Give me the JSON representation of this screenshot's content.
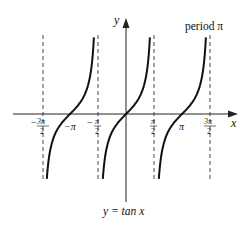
{
  "chart_data": {
    "type": "line",
    "title": "y = tan x",
    "annotation": "period π",
    "xlabel": "x",
    "ylabel": "y",
    "function": "tan(x)",
    "x_range": [
      -4.71,
      4.71
    ],
    "asymptotes": [
      "-3π/2",
      "-π/2",
      "π/2",
      "3π/2"
    ],
    "x_ticks": [
      {
        "value": -4.712,
        "label_num": "3π",
        "label_den": "2",
        "sign": "−"
      },
      {
        "value": -3.1416,
        "label": "−π"
      },
      {
        "value": -1.5708,
        "label_num": "π",
        "label_den": "2",
        "sign": "−"
      },
      {
        "value": 1.5708,
        "label_num": "π",
        "label_den": "2",
        "sign": ""
      },
      {
        "value": 3.1416,
        "label": "π"
      },
      {
        "value": 4.712,
        "label_num": "3π",
        "label_den": "2",
        "sign": ""
      }
    ],
    "zeros": [
      "-π",
      "0",
      "π"
    ],
    "series": [
      {
        "name": "branch (-3π/2, -π/2)",
        "x": [
          -4.45,
          -3.93,
          -3.1416,
          -2.36,
          -1.83
        ],
        "y": [
          -4,
          -1,
          0,
          1,
          4
        ]
      },
      {
        "name": "branch (-π/2, π/2)",
        "x": [
          -1.33,
          -0.785,
          0,
          0.785,
          1.33
        ],
        "y": [
          -4,
          -1,
          0,
          1,
          4
        ]
      },
      {
        "name": "branch (π/2, 3π/2)",
        "x": [
          1.83,
          2.36,
          3.1416,
          3.93,
          4.45
        ],
        "y": [
          -4,
          -1,
          0,
          1,
          4
        ]
      }
    ],
    "grid": false,
    "legend": "none"
  },
  "labels": {
    "y_axis": "y",
    "x_axis": "x",
    "period": "period π",
    "caption": "y = tan x",
    "neg_pi": "−π",
    "pi": "π",
    "minus": "−",
    "three_pi": "3π",
    "pi_frac": "π",
    "two": "2"
  }
}
